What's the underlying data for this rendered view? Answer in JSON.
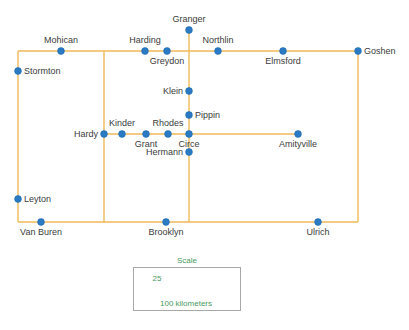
{
  "map": {
    "title": "Network Map",
    "colors": {
      "link": "#f0b95a",
      "node": "#2a7ac4",
      "node_stroke": "#1f69ad",
      "label": "#3b3b3b",
      "scale_text": "#4a9a5e",
      "scale_border": "#a8a8a8",
      "background": "#ffffff"
    },
    "nodes": [
      {
        "id": "granger",
        "label": "Granger",
        "x": 189,
        "y": 30,
        "label_pos": "above"
      },
      {
        "id": "mohican",
        "label": "Mohican",
        "x": 61,
        "y": 51,
        "label_pos": "above"
      },
      {
        "id": "harding",
        "label": "Harding",
        "x": 145,
        "y": 51,
        "label_pos": "above"
      },
      {
        "id": "greydon",
        "label": "Greydon",
        "x": 167,
        "y": 51,
        "label_pos": "below"
      },
      {
        "id": "northlin",
        "label": "Northlin",
        "x": 218,
        "y": 51,
        "label_pos": "above"
      },
      {
        "id": "elmsford",
        "label": "Elmsford",
        "x": 283,
        "y": 51,
        "label_pos": "below"
      },
      {
        "id": "goshen",
        "label": "Goshen",
        "x": 358,
        "y": 51,
        "label_pos": "right"
      },
      {
        "id": "stormton",
        "label": "Stormton",
        "x": 18,
        "y": 71,
        "label_pos": "right"
      },
      {
        "id": "klein",
        "label": "Klein",
        "x": 189,
        "y": 91,
        "label_pos": "left"
      },
      {
        "id": "pippin",
        "label": "Pippin",
        "x": 189,
        "y": 115,
        "label_pos": "right"
      },
      {
        "id": "hardy",
        "label": "Hardy",
        "x": 104,
        "y": 134,
        "label_pos": "left"
      },
      {
        "id": "kinder",
        "label": "Kinder",
        "x": 122,
        "y": 134,
        "label_pos": "above"
      },
      {
        "id": "grant",
        "label": "Grant",
        "x": 146,
        "y": 134,
        "label_pos": "below"
      },
      {
        "id": "rhodes",
        "label": "Rhodes",
        "x": 168,
        "y": 134,
        "label_pos": "above"
      },
      {
        "id": "circe",
        "label": "Circe",
        "x": 189,
        "y": 134,
        "label_pos": "below"
      },
      {
        "id": "amityville",
        "label": "Amityville",
        "x": 298,
        "y": 134,
        "label_pos": "below"
      },
      {
        "id": "hermann",
        "label": "Hermann",
        "x": 189,
        "y": 152,
        "label_pos": "left"
      },
      {
        "id": "leyton",
        "label": "Leyton",
        "x": 18,
        "y": 199,
        "label_pos": "right"
      },
      {
        "id": "van-buren",
        "label": "Van Buren",
        "x": 41,
        "y": 222,
        "label_pos": "below"
      },
      {
        "id": "brooklyn",
        "label": "Brooklyn",
        "x": 166,
        "y": 222,
        "label_pos": "below"
      },
      {
        "id": "ulrich",
        "label": "Ulrich",
        "x": 318,
        "y": 222,
        "label_pos": "below"
      }
    ],
    "links": [
      {
        "id": "top-edge",
        "x1": 18,
        "y1": 51,
        "x2": 358,
        "y2": 51
      },
      {
        "id": "bottom-edge",
        "x1": 18,
        "y1": 222,
        "x2": 358,
        "y2": 222
      },
      {
        "id": "left-edge",
        "x1": 18,
        "y1": 51,
        "x2": 18,
        "y2": 222
      },
      {
        "id": "right-edge",
        "x1": 358,
        "y1": 51,
        "x2": 358,
        "y2": 222
      },
      {
        "id": "granger-spur",
        "x1": 189,
        "y1": 30,
        "x2": 189,
        "y2": 51
      },
      {
        "id": "center-vertical",
        "x1": 189,
        "y1": 51,
        "x2": 189,
        "y2": 222
      },
      {
        "id": "west-vertical",
        "x1": 104,
        "y1": 51,
        "x2": 104,
        "y2": 222
      },
      {
        "id": "center-horizontal",
        "x1": 104,
        "y1": 134,
        "x2": 189,
        "y2": 134
      },
      {
        "id": "amityville-spur",
        "x1": 189,
        "y1": 134,
        "x2": 298,
        "y2": 134
      }
    ]
  },
  "scale": {
    "title": "Scale",
    "box": {
      "x": 133,
      "y": 267,
      "width": 108,
      "height": 44
    },
    "bars": [
      {
        "id": "short-bar",
        "label": "25",
        "label_x": 157,
        "label_y": 274,
        "x1": 141,
        "x2": 175,
        "y": 288
      },
      {
        "id": "long-bar",
        "label": "100 kilometers",
        "label_x": 186,
        "label_y": 299,
        "x1": 141,
        "x2": 233,
        "y": 296
      }
    ]
  }
}
